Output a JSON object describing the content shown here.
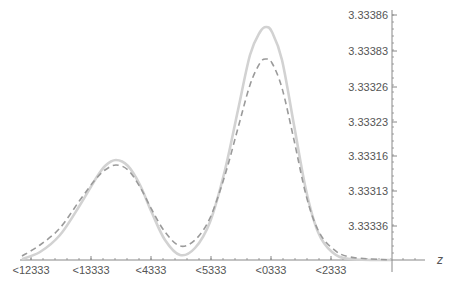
{
  "chart_data": {
    "type": "line",
    "title": "",
    "xlabel": "z",
    "ylabel": "",
    "x_tick_labels": [
      "<12333",
      "<13333",
      "<4333",
      "<5333",
      "<0333",
      "<2333"
    ],
    "y_tick_labels": [
      "3.33386",
      "3.33383",
      "3.33326",
      "3.33323",
      "3.33316",
      "3.33313",
      "3.33336"
    ],
    "grid": false,
    "legend": null,
    "x_pixel_ticks": [
      31,
      91,
      151,
      211,
      271,
      331
    ],
    "y_pixel_ticks": [
      15,
      51,
      87,
      122,
      156,
      191,
      226
    ],
    "series": [
      {
        "name": "solid",
        "style": "solid",
        "color": "#d2d2d2",
        "points_px": [
          [
            22,
            259
          ],
          [
            40,
            252
          ],
          [
            60,
            235
          ],
          [
            80,
            205
          ],
          [
            95,
            180
          ],
          [
            105,
            166
          ],
          [
            116,
            160
          ],
          [
            128,
            166
          ],
          [
            140,
            185
          ],
          [
            152,
            213
          ],
          [
            165,
            240
          ],
          [
            180,
            255
          ],
          [
            195,
            248
          ],
          [
            210,
            222
          ],
          [
            225,
            170
          ],
          [
            238,
            110
          ],
          [
            250,
            55
          ],
          [
            260,
            32
          ],
          [
            266,
            27
          ],
          [
            272,
            32
          ],
          [
            282,
            60
          ],
          [
            294,
            125
          ],
          [
            306,
            190
          ],
          [
            318,
            232
          ],
          [
            332,
            252
          ],
          [
            350,
            259
          ],
          [
            392,
            260
          ]
        ]
      },
      {
        "name": "dashed",
        "style": "dashed",
        "color": "#9a9a9a",
        "points_px": [
          [
            22,
            256
          ],
          [
            40,
            245
          ],
          [
            60,
            228
          ],
          [
            80,
            200
          ],
          [
            95,
            180
          ],
          [
            105,
            170
          ],
          [
            116,
            165
          ],
          [
            128,
            170
          ],
          [
            140,
            187
          ],
          [
            152,
            210
          ],
          [
            165,
            232
          ],
          [
            180,
            246
          ],
          [
            195,
            240
          ],
          [
            210,
            218
          ],
          [
            225,
            175
          ],
          [
            238,
            128
          ],
          [
            250,
            85
          ],
          [
            260,
            63
          ],
          [
            266,
            59
          ],
          [
            272,
            63
          ],
          [
            282,
            88
          ],
          [
            294,
            140
          ],
          [
            306,
            195
          ],
          [
            318,
            230
          ],
          [
            332,
            248
          ],
          [
            350,
            257
          ],
          [
            392,
            260
          ]
        ]
      }
    ]
  },
  "axes": {
    "color": "#888888",
    "x_axis_y": 260,
    "y_axis_x": 392
  }
}
